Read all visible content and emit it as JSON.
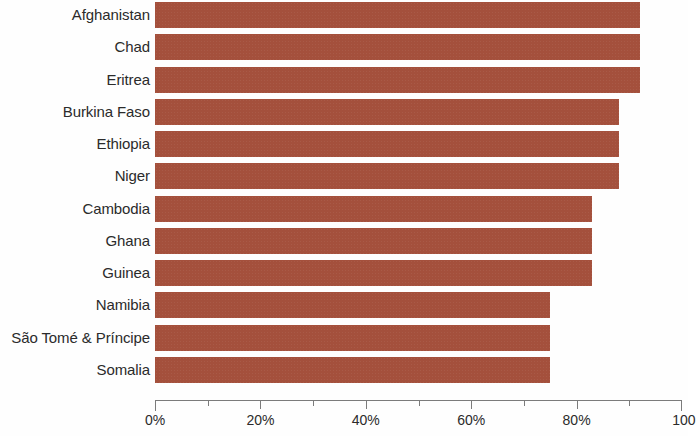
{
  "chart_data": {
    "type": "bar",
    "orientation": "horizontal",
    "title": "",
    "subtitle": "",
    "xlabel": "",
    "ylabel": "",
    "xlim": [
      0,
      100
    ],
    "grid": false,
    "legend": null,
    "bar_color": "#a4503c",
    "axis_color": "#7b7b7b",
    "text_color": "#2b2b2b",
    "categories": [
      "Afghanistan",
      "Chad",
      "Eritrea",
      "Burkina Faso",
      "Ethiopia",
      "Niger",
      "Cambodia",
      "Ghana",
      "Guinea",
      "Namibia",
      "São Tomé & Príncipe",
      "Somalia"
    ],
    "values": [
      92,
      92,
      92,
      88,
      88,
      88,
      83,
      83,
      83,
      75,
      75,
      75
    ],
    "value_unit": "%",
    "x_ticks": [
      {
        "value": 0,
        "label": "0%",
        "type": "major"
      },
      {
        "value": 10,
        "label": "",
        "type": "minor"
      },
      {
        "value": 20,
        "label": "20%",
        "type": "major"
      },
      {
        "value": 30,
        "label": "",
        "type": "minor"
      },
      {
        "value": 40,
        "label": "40%",
        "type": "major"
      },
      {
        "value": 50,
        "label": "",
        "type": "minor"
      },
      {
        "value": 60,
        "label": "60%",
        "type": "major"
      },
      {
        "value": 70,
        "label": "",
        "type": "minor"
      },
      {
        "value": 80,
        "label": "80%",
        "type": "major"
      },
      {
        "value": 90,
        "label": "",
        "type": "minor"
      },
      {
        "value": 100,
        "label": "100",
        "type": "major"
      }
    ]
  }
}
